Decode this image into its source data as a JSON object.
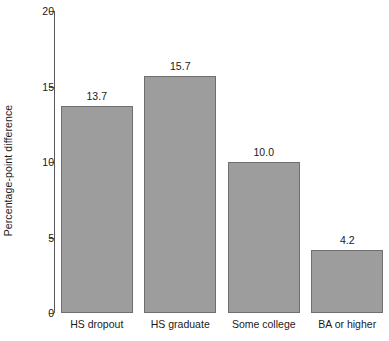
{
  "chart_data": {
    "type": "bar",
    "title": "",
    "subtitle": "",
    "xlabel": "",
    "ylabel": "Percentage-point difference",
    "categories": [
      "HS dropout",
      "HS graduate",
      "Some college",
      "BA or higher"
    ],
    "values": [
      13.7,
      15.7,
      10.0,
      4.2
    ],
    "value_labels": [
      "13.7",
      "15.7",
      "10.0",
      "4.2"
    ],
    "ylim": [
      0,
      20
    ],
    "yticks": [
      0,
      5,
      10,
      15,
      20
    ],
    "ytick_labels": [
      "0",
      "5",
      "10",
      "15",
      "20"
    ],
    "grid": false,
    "legend": null,
    "annotations": [],
    "colors": {
      "bar_fill": "#9d9d9d",
      "bar_border": "#6f6f6f",
      "axis": "#5a5a5a",
      "text": "#1a1a1a",
      "background": "#ffffff"
    }
  }
}
